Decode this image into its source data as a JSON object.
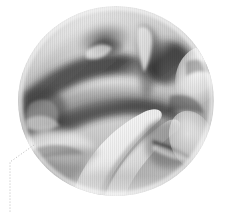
{
  "figure": {
    "background_color": "#ffffff",
    "width": 229,
    "height": 212
  },
  "chart_data": {
    "type": "surface",
    "title": "",
    "subtitle": "",
    "xlabel": "",
    "ylabel": "",
    "zlabel": "",
    "tick_labels": [],
    "legend": [],
    "grid": false,
    "colormap": "grayscale",
    "shading": "smooth-gouraud",
    "mesh_lines": "vertical-striations",
    "domain_shape": "disk",
    "domain": {
      "center_x": 116,
      "center_y": 101,
      "radius_x": 98,
      "radius_y": 95,
      "x_range": [
        -1,
        1
      ],
      "y_range": [
        -1,
        1
      ],
      "z_range": [
        -1,
        1
      ]
    },
    "value_range": [
      0.04,
      1.0
    ],
    "darkest_value": "#1a1a1a",
    "lightest_value": "#fbfbfb",
    "features": [
      {
        "name": "upper-left-ridge",
        "x": 72,
        "y": 44,
        "value": "dark-crease"
      },
      {
        "name": "upper-center-hollow",
        "x": 100,
        "y": 30,
        "value": "light-dome"
      },
      {
        "name": "upper-right-fold",
        "x": 165,
        "y": 58,
        "value": "dark-fold"
      },
      {
        "name": "right-lobe",
        "x": 196,
        "y": 80,
        "value": "light-lobe"
      },
      {
        "name": "central-saddle",
        "x": 118,
        "y": 100,
        "value": "mid-gray"
      },
      {
        "name": "left-crescent",
        "x": 40,
        "y": 110,
        "value": "dark-crescent"
      },
      {
        "name": "lower-bright-sheet",
        "x": 110,
        "y": 158,
        "value": "bright-sheet"
      },
      {
        "name": "lower-right-spike",
        "x": 183,
        "y": 150,
        "value": "thin-spike"
      },
      {
        "name": "bottom-shadow",
        "x": 140,
        "y": 186,
        "value": "soft-shadow"
      }
    ]
  },
  "annotation": {
    "leader_line": {
      "name": "callout-leader-line",
      "style": "dashed",
      "color": "#b9b9b9",
      "dash_pattern": "1 2",
      "width": 1,
      "anchor_x": 34,
      "anchor_y": 145,
      "bend_x": 10,
      "bend_y": 162,
      "end_x": 10,
      "end_y": 212,
      "label": ""
    }
  }
}
